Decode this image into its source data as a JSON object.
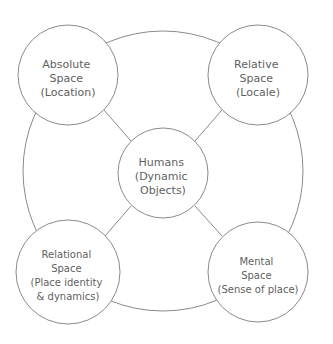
{
  "diagram": {
    "background_color": "#ffffff",
    "stroke_color": "#8a8a8a",
    "text_color": "#5f5f5f",
    "outer_ring": {
      "cx": 163,
      "cy": 171,
      "r": 140
    },
    "center_node": {
      "id": "humans",
      "cx": 163,
      "cy": 173,
      "r": 45,
      "lines": [
        "Humans",
        "(Dynamic",
        "Objects)"
      ]
    },
    "nodes": [
      {
        "id": "absolute-space",
        "position": "top-left",
        "cx": 68,
        "cy": 75,
        "r": 50,
        "lines": [
          "Absolute",
          "Space",
          "(Location)"
        ]
      },
      {
        "id": "relative-space",
        "position": "top-right",
        "cx": 258,
        "cy": 75,
        "r": 50,
        "lines": [
          "Relative",
          "Space",
          "(Locale)"
        ]
      },
      {
        "id": "relational-space",
        "position": "bottom-left",
        "cx": 68,
        "cy": 272,
        "r": 52,
        "lines": [
          "Relational",
          "Space",
          "(Place identity",
          "& dynamics)"
        ]
      },
      {
        "id": "mental-space",
        "position": "bottom-right",
        "cx": 258,
        "cy": 272,
        "r": 50,
        "lines": [
          "Mental",
          "Space",
          "(Sense of place)"
        ]
      }
    ],
    "connectors": [
      {
        "id": "absolute-to-humans",
        "from": "absolute-space",
        "to": "humans",
        "x1": 104,
        "y1": 110,
        "x2": 131,
        "y2": 141
      },
      {
        "id": "relative-to-humans",
        "from": "relative-space",
        "to": "humans",
        "x1": 222,
        "y1": 110,
        "x2": 195,
        "y2": 141
      },
      {
        "id": "relational-to-humans",
        "from": "relational-space",
        "to": "humans",
        "x1": 105,
        "y1": 236,
        "x2": 131,
        "y2": 206
      },
      {
        "id": "mental-to-humans",
        "from": "mental-space",
        "to": "humans",
        "x1": 222,
        "y1": 236,
        "x2": 195,
        "y2": 206
      }
    ]
  }
}
